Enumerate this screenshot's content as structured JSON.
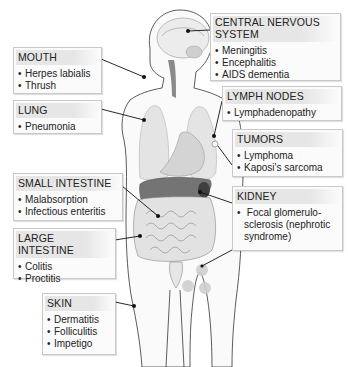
{
  "figure": {
    "colors": {
      "box_background": "#fbfbfb",
      "box_border": "#c9c9c9",
      "title_band": "#e6e6e6",
      "organ_light": "#e4e4e4",
      "organ_mid": "#c8c8c8",
      "liver_dark": "#6e6e6e",
      "leader_line": "#111111"
    }
  },
  "labels": {
    "mouth": {
      "title": "MOUTH",
      "items": [
        "Herpes labialis",
        "Thrush"
      ]
    },
    "lung": {
      "title": "LUNG",
      "items": [
        "Pneumonia"
      ]
    },
    "cns": {
      "title": "CENTRAL NERVOUS SYSTEM",
      "title_line1": "CENTRAL NERVOUS",
      "title_line2": "SYSTEM",
      "items": [
        "Meningitis",
        "Encephalitis",
        "AIDS dementia"
      ]
    },
    "lymph_nodes": {
      "title": "LYMPH NODES",
      "items": [
        "Lymphadenopathy"
      ]
    },
    "tumors": {
      "title": "TUMORS",
      "items": [
        "Lymphoma",
        "Kaposi's sarcoma"
      ]
    },
    "small_intestine": {
      "title": "SMALL INTESTINE",
      "items": [
        "Malabsorption",
        "Infectious enteritis"
      ]
    },
    "kidney": {
      "title": "KIDNEY",
      "items": [
        "Focal glomerulo-sclerosis (nephrotic syndrome)"
      ],
      "item_lines": [
        "Focal glomerulo-",
        "sclerosis (nephrotic",
        "syndrome)"
      ]
    },
    "large_intestine": {
      "title": "LARGE INTESTINE",
      "items": [
        "Colitis",
        "Proctitis"
      ]
    },
    "skin": {
      "title": "SKIN",
      "items": [
        "Dermatitis",
        "Folliculitis",
        "Impetigo"
      ]
    }
  }
}
